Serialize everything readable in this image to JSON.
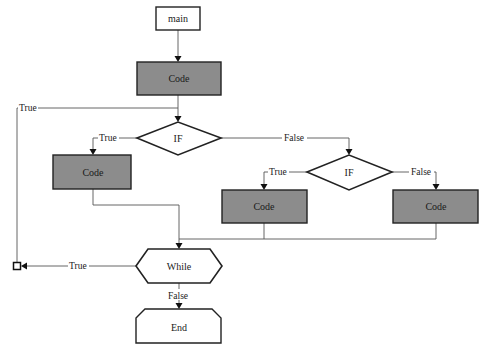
{
  "diagram": {
    "type": "flowchart",
    "colors": {
      "code_fill": "#8c8c8c",
      "terminal_fill": "#ffffff",
      "stroke": "#222222",
      "edge": "#555555"
    },
    "nodes": {
      "main": {
        "label": "main",
        "shape": "rectangle"
      },
      "code_top": {
        "label": "Code",
        "shape": "filled-rectangle"
      },
      "if_outer": {
        "label": "IF",
        "shape": "diamond"
      },
      "code_left": {
        "label": "Code",
        "shape": "filled-rectangle"
      },
      "if_inner": {
        "label": "IF",
        "shape": "diamond"
      },
      "code_mid": {
        "label": "Code",
        "shape": "filled-rectangle"
      },
      "code_right": {
        "label": "Code",
        "shape": "filled-rectangle"
      },
      "while": {
        "label": "While",
        "shape": "hexagon"
      },
      "end": {
        "label": "End",
        "shape": "chamfered-rectangle"
      }
    },
    "edges": {
      "loop_back_true": {
        "label": "True"
      },
      "if_outer_true": {
        "label": "True"
      },
      "if_outer_false": {
        "label": "False"
      },
      "if_inner_true": {
        "label": "True"
      },
      "if_inner_false": {
        "label": "False"
      },
      "while_true": {
        "label": "True"
      },
      "while_false": {
        "label": "False"
      }
    }
  }
}
